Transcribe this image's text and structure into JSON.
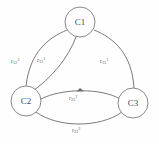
{
  "figure": {
    "type": "node-link-graph",
    "background_color": "#fefefe",
    "stroke_color": "#6b6b6b",
    "text_color": "#5c5c5c"
  },
  "nodes": [
    {
      "id": "C1",
      "label": "C1",
      "x": 80,
      "y": 22,
      "r": 15
    },
    {
      "id": "C2",
      "label": "C2",
      "x": 26,
      "y": 101,
      "r": 15
    },
    {
      "id": "C3",
      "label": "C3",
      "x": 133,
      "y": 103,
      "r": 15
    }
  ],
  "edges": [
    {
      "id": "e-c1-c2-outer",
      "from": "C1",
      "to": "C2",
      "directed": false,
      "label": {
        "base": "r",
        "sub": "12",
        "sup": "2"
      },
      "label_x": 11,
      "label_y": 58
    },
    {
      "id": "e-c1-c2-inner",
      "from": "C1",
      "to": "C2",
      "directed": false,
      "label": {
        "base": "r",
        "sub": "12",
        "sup": "1"
      },
      "label_x": 37,
      "label_y": 57
    },
    {
      "id": "e-c1-c3",
      "from": "C1",
      "to": "C3",
      "directed": false,
      "label": {
        "base": "r",
        "sub": "13",
        "sup": "1"
      },
      "label_x": 100,
      "label_y": 58
    },
    {
      "id": "e-c2-c3-upper",
      "from": "C2",
      "to": "C3",
      "directed": true,
      "label": {
        "base": "r",
        "sub": "23",
        "sup": "1"
      },
      "label_x": 69,
      "label_y": 95
    },
    {
      "id": "e-c2-c3-lower",
      "from": "C2",
      "to": "C3",
      "directed": false,
      "label": {
        "base": "r",
        "sub": "23",
        "sup": "2"
      },
      "label_x": 72,
      "label_y": 127
    }
  ]
}
